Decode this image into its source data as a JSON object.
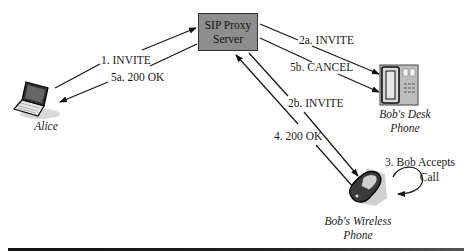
{
  "diagram": {
    "type": "SIP forking call flow",
    "nodes": {
      "proxy": {
        "line1": "SIP Proxy",
        "line2": "Server",
        "fill": "#8e8e8e"
      },
      "alice": {
        "label": "Alice",
        "icon": "laptop-icon"
      },
      "desk_phone": {
        "line1": "Bob's Desk",
        "line2": "Phone",
        "icon": "desk-phone-icon"
      },
      "wireless_phone": {
        "line1": "Bob's Wireless",
        "line2": "Phone",
        "icon": "mobile-phone-icon"
      }
    },
    "messages": [
      {
        "id": "1",
        "label": "1. INVITE",
        "from": "alice",
        "to": "proxy"
      },
      {
        "id": "5a",
        "label": "5a. 200 OK",
        "from": "proxy",
        "to": "alice"
      },
      {
        "id": "2a",
        "label": "2a. INVITE",
        "from": "proxy",
        "to": "desk_phone"
      },
      {
        "id": "5b",
        "label": "5b. CANCEL",
        "from": "proxy",
        "to": "desk_phone"
      },
      {
        "id": "2b",
        "label": "2b. INVITE",
        "from": "proxy",
        "to": "wireless_phone"
      },
      {
        "id": "4",
        "label": "4. 200 OK",
        "from": "wireless_phone",
        "to": "proxy"
      }
    ],
    "self_action": {
      "line1": "3. Bob Accepts",
      "line2": "Call",
      "node": "wireless_phone"
    }
  }
}
